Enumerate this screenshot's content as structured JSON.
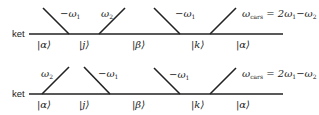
{
  "diagrams": [
    {
      "row_label": "ket",
      "interactions": [
        {
          "label": "−ω",
          "sub": "1",
          "direction": "down"
        },
        {
          "label": "ω",
          "sub": "2",
          "direction": "up"
        },
        {
          "label": "−ω",
          "sub": "1",
          "direction": "down"
        },
        {
          "label": "ω",
          "sub": "cars",
          "direction": "up",
          "suffix": " = 2ω",
          "suffix_sub": "1",
          "suffix_tail": "−ω",
          "suffix_tail_sub": "2"
        }
      ],
      "states": [
        "|α⟩",
        "|j⟩",
        "|β⟩",
        "|k⟩",
        "|α⟩"
      ]
    },
    {
      "row_label": "ket",
      "interactions": [
        {
          "label": "ω",
          "sub": "2",
          "direction": "up"
        },
        {
          "label": "−ω",
          "sub": "1",
          "direction": "down"
        },
        {
          "label": "−ω",
          "sub": "1",
          "direction": "down"
        },
        {
          "label": "ω",
          "sub": "cars",
          "direction": "up",
          "suffix": " = 2ω",
          "suffix_sub": "1",
          "suffix_tail": "−ω",
          "suffix_tail_sub": "2"
        }
      ],
      "states": [
        "|α⟩",
        "|j⟩",
        "|β⟩",
        "|k⟩",
        "|α⟩"
      ]
    }
  ]
}
